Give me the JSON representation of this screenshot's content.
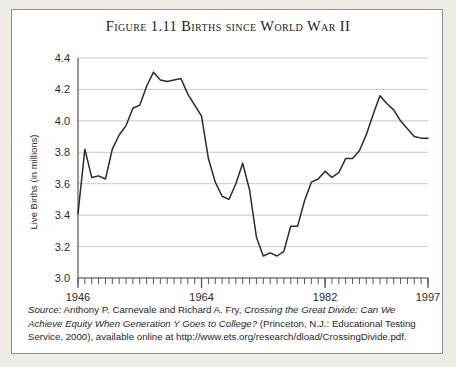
{
  "figure": {
    "title": "Figure 1.11  Births since World War II",
    "source_prefix": "Source:",
    "source_authors": " Anthony P. Carnevale and Richard A. Fry, ",
    "source_worktitle": "Crossing the Great Divide: Can We Achieve Equity When Generation Y Goes to College?",
    "source_tail": " (Princeton, N.J.: Educational Testing Service, 2000), available online at http://www.ets.org/research/dload/CrossingDivide.pdf."
  },
  "colors": {
    "line": "#2b2b2b",
    "grid": "#c9c9c9",
    "axis": "#55555a",
    "card_background": "#ffffff",
    "page_background": "#efece6",
    "border": "#8e8e8e"
  },
  "chart_data": {
    "type": "line",
    "title": "Figure 1.11  Births since World War II",
    "xlabel": "",
    "ylabel": "Live Births (in millions)",
    "xlim": [
      1946,
      1997
    ],
    "ylim": [
      3.0,
      4.4
    ],
    "grid": true,
    "legend": false,
    "y_ticks": [
      "3.0",
      "3.2",
      "3.4",
      "3.6",
      "3.8",
      "4.0",
      "4.2",
      "4.4"
    ],
    "y_tick_values": [
      3.0,
      3.2,
      3.4,
      3.6,
      3.8,
      4.0,
      4.2,
      4.4
    ],
    "x_ticks": [
      "1946",
      "1964",
      "1982",
      "1997"
    ],
    "x_tick_values": [
      1946,
      1964,
      1982,
      1997
    ],
    "x_minor_tick_step": 1,
    "x": [
      1946,
      1947,
      1948,
      1949,
      1950,
      1951,
      1952,
      1953,
      1954,
      1955,
      1956,
      1957,
      1958,
      1959,
      1960,
      1961,
      1962,
      1963,
      1964,
      1965,
      1966,
      1967,
      1968,
      1969,
      1970,
      1971,
      1972,
      1973,
      1974,
      1975,
      1976,
      1977,
      1978,
      1979,
      1980,
      1981,
      1982,
      1983,
      1984,
      1985,
      1986,
      1987,
      1988,
      1989,
      1990,
      1991,
      1992,
      1993,
      1994,
      1995,
      1996,
      1997
    ],
    "values": [
      3.41,
      3.82,
      3.64,
      3.65,
      3.63,
      3.82,
      3.91,
      3.97,
      4.08,
      4.1,
      4.22,
      4.31,
      4.26,
      4.25,
      4.26,
      4.27,
      4.17,
      4.1,
      4.03,
      3.76,
      3.61,
      3.52,
      3.5,
      3.6,
      3.73,
      3.56,
      3.26,
      3.14,
      3.16,
      3.14,
      3.17,
      3.33,
      3.33,
      3.49,
      3.61,
      3.63,
      3.68,
      3.64,
      3.67,
      3.76,
      3.76,
      3.81,
      3.91,
      4.04,
      4.16,
      4.11,
      4.07,
      4.0,
      3.95,
      3.9,
      3.89,
      3.89
    ]
  }
}
